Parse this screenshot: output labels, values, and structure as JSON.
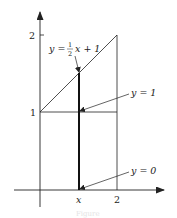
{
  "diagram": {
    "axes": {
      "x_ticks": [
        {
          "value": 2,
          "label": "2"
        }
      ],
      "x_var_label": "x",
      "y_ticks": [
        {
          "value": 1,
          "label": "1"
        },
        {
          "value": 2,
          "label": "2"
        }
      ]
    },
    "labels": {
      "upper_curve": {
        "lhs": "y =",
        "frac_num": "1",
        "frac_den": "2",
        "rhs": "x + 1"
      },
      "middle_line": "y = 1",
      "lower_line": "y = 0"
    },
    "colors": {
      "line": "#222222",
      "background": "#ffffff"
    },
    "caption": "Figure"
  }
}
